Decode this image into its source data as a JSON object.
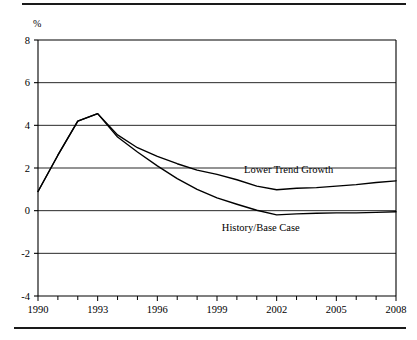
{
  "figure": {
    "top_rule": "horizontal-rule",
    "bottom_rule": "horizontal-rule"
  },
  "chart_data": {
    "type": "line",
    "title": "",
    "subtitle": "",
    "xlabel": "",
    "ylabel": "%",
    "ylim": [
      -4,
      8
    ],
    "xlim": [
      1990,
      2008
    ],
    "grid": true,
    "grid_axis": "y",
    "legend_position": "inline-annotation",
    "y_ticks": [
      8,
      6,
      4,
      2,
      0,
      -2,
      -4
    ],
    "y_tick_labels": [
      "8",
      "6",
      "4",
      "2",
      "0",
      "-2",
      "-4"
    ],
    "x_ticks": [
      1990,
      1991,
      1992,
      1993,
      1994,
      1995,
      1996,
      1997,
      1998,
      1999,
      2000,
      2001,
      2002,
      2003,
      2004,
      2005,
      2006,
      2007,
      2008
    ],
    "x_tick_labels_major": [
      "1990",
      "1993",
      "1996",
      "1999",
      "2002",
      "2005",
      "2008"
    ],
    "x_major_values": [
      1990,
      1993,
      1996,
      1999,
      2002,
      2005,
      2008
    ],
    "x": [
      1990,
      1991,
      1992,
      1993,
      1994,
      1995,
      1996,
      1997,
      1998,
      1999,
      2000,
      2001,
      2002,
      2003,
      2004,
      2005,
      2006,
      2007,
      2008
    ],
    "series": [
      {
        "name": "Lower Trend Growth",
        "color": "#000000",
        "label_x": 2002.6,
        "label_y": 1.95,
        "values": [
          0.9,
          2.6,
          4.2,
          4.55,
          3.55,
          2.95,
          2.55,
          2.2,
          1.9,
          1.7,
          1.45,
          1.15,
          0.98,
          1.05,
          1.08,
          1.15,
          1.22,
          1.32,
          1.4
        ]
      },
      {
        "name": "History/Base Case",
        "color": "#000000",
        "label_x": 2001.2,
        "label_y": -0.78,
        "values": [
          0.9,
          2.6,
          4.2,
          4.55,
          3.45,
          2.75,
          2.1,
          1.5,
          1.0,
          0.6,
          0.3,
          0.02,
          -0.2,
          -0.15,
          -0.12,
          -0.1,
          -0.1,
          -0.08,
          -0.05
        ]
      }
    ],
    "annotations": [
      {
        "text": "Lower Trend Growth",
        "x": 2002.6,
        "y": 1.95
      },
      {
        "text": "History/Base Case",
        "x": 2001.2,
        "y": -0.78
      }
    ]
  }
}
